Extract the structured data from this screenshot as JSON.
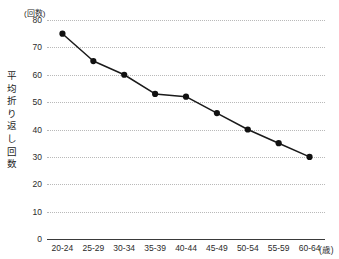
{
  "chart_data": {
    "type": "line",
    "title": "",
    "subtitle": "",
    "xlabel": "",
    "ylabel": "平均折り返し回数",
    "y_unit_label": "(回数)",
    "x_unit_label": "(歳)",
    "categories": [
      "20-24",
      "25-29",
      "30-34",
      "35-39",
      "40-44",
      "45-49",
      "50-54",
      "55-59",
      "60-64"
    ],
    "values": [
      75,
      65,
      60,
      53,
      52,
      46,
      40,
      35,
      30
    ],
    "series": [
      {
        "name": "平均折り返し回数",
        "values": [
          75,
          65,
          60,
          53,
          52,
          46,
          40,
          35,
          30
        ]
      }
    ],
    "ylim": [
      0,
      80
    ],
    "yticks": [
      0,
      10,
      20,
      30,
      40,
      50,
      60,
      70,
      80
    ],
    "ytick_labels": [
      "0",
      "10",
      "20",
      "30",
      "40",
      "50",
      "60",
      "70",
      "80"
    ],
    "grid": true,
    "grid_style": "dotted-horizontal",
    "legend": false,
    "legend_position": "none",
    "marker": "filled-circle",
    "line_color": "#1a1a1a",
    "marker_color": "#111111",
    "grid_color": "#b9b9b9",
    "axis_color": "#3a3a3a",
    "background": "#ffffff"
  }
}
